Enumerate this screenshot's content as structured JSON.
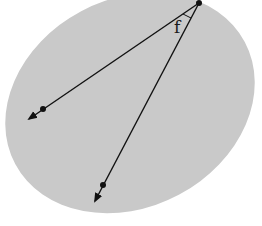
{
  "diagram": {
    "type": "geometry-angle-in-plane",
    "plane": {
      "shape": "ellipse",
      "fill": "#c9c9c9"
    },
    "vertex": {
      "x": 199,
      "y": 3
    },
    "rays": [
      {
        "name": "left-ray",
        "point": {
          "x": 43,
          "y": 109
        },
        "arrow_end": {
          "x": 29,
          "y": 119
        }
      },
      {
        "name": "lower-ray",
        "point": {
          "x": 103,
          "y": 185
        },
        "arrow_end": {
          "x": 95,
          "y": 201
        }
      }
    ],
    "angle_label": "f",
    "colors": {
      "ink": "#111111",
      "plane": "#c9c9c9",
      "background": "#ffffff"
    }
  }
}
